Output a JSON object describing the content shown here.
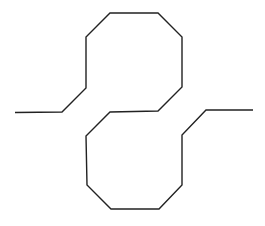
{
  "diagram": {
    "type": "line-drawing",
    "stroke_color": "#222222",
    "stroke_width": 1.4,
    "background": "#ffffff",
    "path_points": [
      [
        15,
        112.5
      ],
      [
        62,
        112
      ],
      [
        86,
        88
      ],
      [
        86,
        37
      ],
      [
        110,
        13
      ],
      [
        158,
        13
      ],
      [
        182,
        37
      ],
      [
        182,
        87
      ],
      [
        158,
        111
      ],
      [
        110,
        112
      ],
      [
        86,
        136
      ],
      [
        87,
        185
      ],
      [
        111,
        209
      ],
      [
        159,
        209
      ],
      [
        182,
        185
      ],
      [
        182,
        135
      ],
      [
        206,
        110
      ],
      [
        253,
        110
      ]
    ],
    "segments": {
      "left_lead": {
        "from": [
          15,
          112.5
        ],
        "to": [
          62,
          112
        ]
      },
      "upper_loop": [
        "(86,88)",
        "(86,37)",
        "(110,13)",
        "(158,13)",
        "(182,37)",
        "(182,87)",
        "(158,111)"
      ],
      "crossing": {
        "from": [
          158,
          111
        ],
        "to": [
          110,
          112
        ]
      },
      "lower_loop": [
        "(86,136)",
        "(87,185)",
        "(111,209)",
        "(159,209)",
        "(182,185)",
        "(182,135)"
      ],
      "right_lead": {
        "from": [
          206,
          110
        ],
        "to": [
          253,
          110
        ]
      }
    }
  }
}
